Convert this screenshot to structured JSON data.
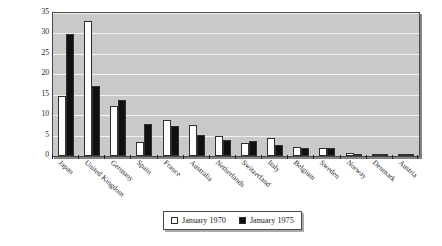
{
  "chart_data": {
    "type": "bar",
    "title": "",
    "xlabel": "",
    "ylabel_lines": [
      "Weight of each country within",
      "MSCI EAFE Index"
    ],
    "ylabel": "Weight of each country within MSCI EAFE Index",
    "ylim": [
      0,
      35
    ],
    "yticks": [
      35,
      30,
      25,
      20,
      15,
      10,
      5,
      0
    ],
    "ytick_labels": [
      "35",
      "30",
      "25",
      "20",
      "15",
      "10",
      "5",
      "0"
    ],
    "grid": true,
    "grid_orientation": "horizontal",
    "legend_position": "bottom-center",
    "categories": [
      "Japan",
      "United Kingdom",
      "Germany",
      "Spain",
      "France",
      "Australia",
      "Netherlands",
      "Switzerland",
      "Italy",
      "Belgium",
      "Sweden",
      "Norway",
      "Denmark",
      "Austria"
    ],
    "series": [
      {
        "name": "January 1970",
        "color": "#ffffff",
        "values": [
          14.8,
          33.0,
          12.3,
          3.5,
          8.9,
          7.6,
          4.8,
          3.1,
          4.3,
          2.3,
          2.0,
          0.7,
          0.5,
          0.4
        ]
      },
      {
        "name": "January 1975",
        "color": "#101010",
        "values": [
          29.8,
          17.2,
          13.7,
          7.8,
          7.4,
          5.1,
          4.0,
          3.7,
          2.6,
          2.0,
          2.0,
          0.6,
          0.5,
          0.4
        ]
      }
    ]
  },
  "legend": {
    "entries": [
      {
        "label": "January 1970",
        "swatch": "open-square-icon"
      },
      {
        "label": "January 1975",
        "swatch": "filled-square-icon"
      }
    ]
  }
}
